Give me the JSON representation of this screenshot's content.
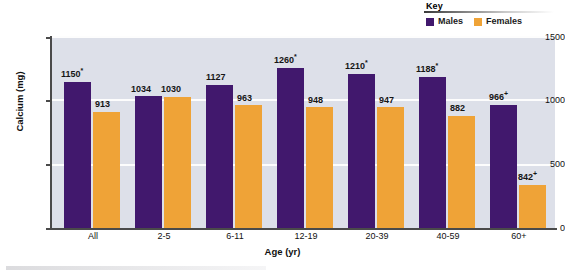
{
  "chart_data": {
    "type": "bar",
    "title": "",
    "xlabel": "Age (yr)",
    "ylabel": "Calcium (mg)",
    "ylim": [
      0,
      1500
    ],
    "yticks": [
      0,
      500,
      1000,
      1500
    ],
    "ytick_labels": [
      "0",
      "500",
      "1000",
      "1500"
    ],
    "grid": true,
    "legend_position": "top-right",
    "legend_title": "Key",
    "categories": [
      "All",
      "2-5",
      "6-11",
      "12-19",
      "20-39",
      "40-59",
      "60+"
    ],
    "series": [
      {
        "name": "Males",
        "color": "#41186d",
        "values": [
          1150,
          1034,
          1127,
          1260,
          1210,
          1188,
          966
        ],
        "labels": [
          "1150*",
          "1034",
          "1127",
          "1260*",
          "1210*",
          "1188*",
          "966+"
        ],
        "drawn_values": [
          1150,
          1034,
          1127,
          1260,
          1210,
          1188,
          966
        ]
      },
      {
        "name": "Females",
        "color": "#efa337",
        "values": [
          913,
          1030,
          963,
          948,
          947,
          882,
          842
        ],
        "labels": [
          "913",
          "1030",
          "963",
          "948",
          "947",
          "882",
          "842+"
        ],
        "drawn_values": [
          913,
          1030,
          963,
          948,
          947,
          882,
          340
        ]
      }
    ],
    "annotation_markers": [
      "*",
      "+"
    ]
  },
  "legend": {
    "title": "Key",
    "items": [
      {
        "label": "Males",
        "color": "#41186d"
      },
      {
        "label": "Females",
        "color": "#efa337"
      }
    ]
  },
  "axes": {
    "y_title": "Calcium (mg)",
    "x_title": "Age (yr)",
    "y_ticks": [
      "1500",
      "1000",
      "500",
      "0"
    ],
    "x_ticks": [
      "All",
      "2-5",
      "6-11",
      "12-19",
      "20-39",
      "40-59",
      "60+"
    ]
  },
  "value_labels": {
    "g0": {
      "male": "1150*",
      "female": "913"
    },
    "g1": {
      "male": "1034",
      "female": "1030"
    },
    "g2": {
      "male": "1127",
      "female": "963"
    },
    "g3": {
      "male": "1260*",
      "female": "948"
    },
    "g4": {
      "male": "1210*",
      "female": "947"
    },
    "g5": {
      "male": "1188*",
      "female": "882"
    },
    "g6": {
      "male": "966+",
      "female": "842+"
    }
  },
  "colors": {
    "male_bar": "#41186d",
    "female_bar": "#efa337",
    "plot_background": "#dde0e9",
    "gridline": "#fdfdfd",
    "axis": "#4a4a4a",
    "page_background": "#ffffff"
  }
}
